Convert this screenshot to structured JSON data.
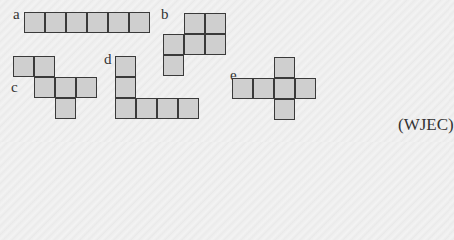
{
  "cell_size": 21,
  "nets": [
    {
      "label": "a",
      "label_pos": [
        13,
        7
      ],
      "origin": [
        24,
        12
      ],
      "cells": [
        [
          0,
          0
        ],
        [
          1,
          0
        ],
        [
          2,
          0
        ],
        [
          3,
          0
        ],
        [
          4,
          0
        ],
        [
          5,
          0
        ]
      ]
    },
    {
      "label": "b",
      "label_pos": [
        161,
        7
      ],
      "origin": [
        163,
        13
      ],
      "cells": [
        [
          1,
          0
        ],
        [
          2,
          0
        ],
        [
          0,
          1
        ],
        [
          1,
          1
        ],
        [
          2,
          1
        ],
        [
          0,
          2
        ]
      ]
    },
    {
      "label": "c",
      "label_pos": [
        11,
        80
      ],
      "origin": [
        13,
        56
      ],
      "cells": [
        [
          0,
          0
        ],
        [
          1,
          0
        ],
        [
          1,
          1
        ],
        [
          2,
          1
        ],
        [
          3,
          1
        ],
        [
          2,
          2
        ]
      ]
    },
    {
      "label": "d",
      "label_pos": [
        104,
        52
      ],
      "origin": [
        115,
        56
      ],
      "cells": [
        [
          0,
          0
        ],
        [
          0,
          1
        ],
        [
          0,
          2
        ],
        [
          1,
          2
        ],
        [
          2,
          2
        ],
        [
          3,
          2
        ]
      ]
    },
    {
      "label": "e",
      "label_pos": [
        230,
        68
      ],
      "origin": [
        232,
        57
      ],
      "cells": [
        [
          2,
          0
        ],
        [
          0,
          1
        ],
        [
          1,
          1
        ],
        [
          2,
          1
        ],
        [
          3,
          1
        ],
        [
          2,
          2
        ]
      ]
    }
  ],
  "source": "(WJEC)"
}
